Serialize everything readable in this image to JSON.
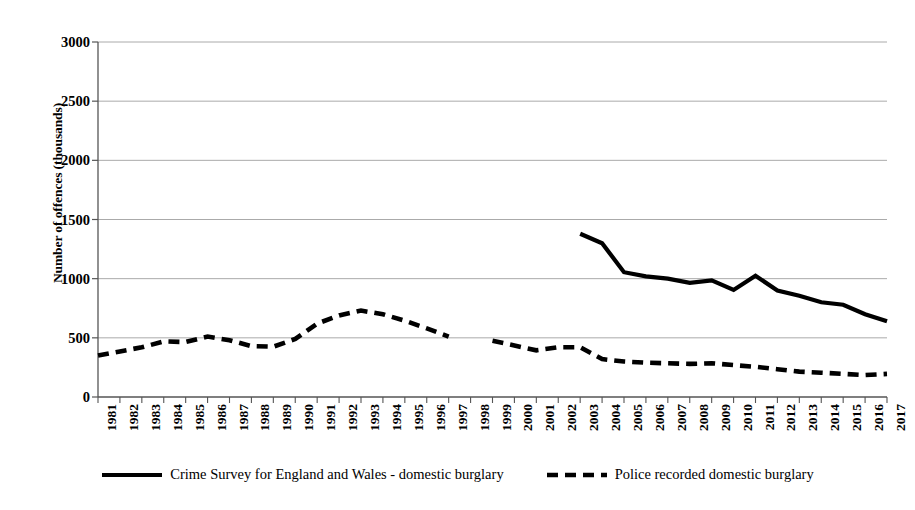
{
  "chart_data": {
    "type": "line",
    "title": "",
    "xlabel": "",
    "ylabel": "Number of offences (thousands)",
    "ylim": [
      0,
      3000
    ],
    "ytick_labels": [
      "3000",
      "2500",
      "2000",
      "1500",
      "1000",
      "500",
      "0"
    ],
    "yticks": [
      3000,
      2500,
      2000,
      1500,
      1000,
      500,
      0
    ],
    "grid": "horizontal",
    "legend_position": "bottom-center",
    "categories": [
      "1981",
      "1982",
      "1983",
      "1984",
      "1985",
      "1986",
      "1987",
      "1988",
      "1989",
      "1990",
      "1991",
      "1992",
      "1993",
      "1994",
      "1995",
      "1996",
      "1997",
      "1998",
      "1999",
      "2000",
      "2001",
      "2002",
      "2003",
      "2004",
      "2005",
      "2006",
      "2007",
      "2008",
      "2009",
      "2010",
      "2011",
      "2012",
      "2013",
      "2014",
      "2015",
      "2016",
      "2017"
    ],
    "x": [
      1981,
      1982,
      1983,
      1984,
      1985,
      1986,
      1987,
      1988,
      1989,
      1990,
      1991,
      1992,
      1993,
      1994,
      1995,
      1996,
      1997,
      1998,
      1999,
      2000,
      2001,
      2002,
      2003,
      2004,
      2005,
      2006,
      2007,
      2008,
      2009,
      2010,
      2011,
      2012,
      2013,
      2014,
      2015,
      2016,
      2017
    ],
    "series": [
      {
        "name": "Crime Survey for England and Wales - domestic burglary",
        "style": "solid",
        "color": "#000000",
        "values": [
          980,
          null,
          1055,
          null,
          1130,
          null,
          1280,
          null,
          1430,
          null,
          1730,
          null,
          2445,
          null,
          2400,
          null,
          1985,
          null,
          1620,
          null,
          1410,
          null,
          1380,
          1300,
          1055,
          1020,
          1000,
          965,
          985,
          905,
          1025,
          900,
          855,
          800,
          780,
          700,
          640
        ]
      },
      {
        "name": "Police recorded domestic burglary",
        "style": "dashed",
        "color": "#000000",
        "values": [
          350,
          385,
          420,
          470,
          465,
          510,
          480,
          430,
          425,
          490,
          620,
          690,
          730,
          700,
          645,
          580,
          510,
          null,
          475,
          435,
          395,
          420,
          420,
          320,
          300,
          290,
          285,
          280,
          285,
          270,
          255,
          235,
          215,
          205,
          195,
          185,
          195
        ]
      }
    ]
  },
  "legend": {
    "entries": [
      {
        "label": "Crime Survey for England and Wales - domestic burglary",
        "style": "solid"
      },
      {
        "label": "Police recorded domestic burglary",
        "style": "dashed"
      }
    ]
  },
  "axis": {
    "y_title": "Number of offences (thousands)"
  },
  "colors": {
    "line": "#000000",
    "grid": "#aaaaaa",
    "axis": "#555555",
    "background": "#ffffff"
  }
}
